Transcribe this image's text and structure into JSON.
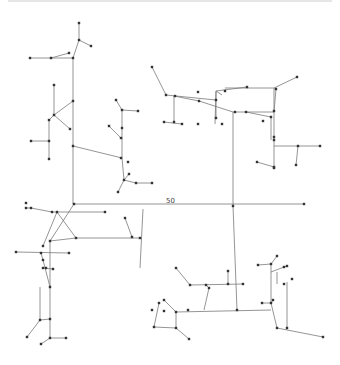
{
  "diagram": {
    "label": "50",
    "label_pos": [
      166,
      203
    ],
    "colors": {
      "edge": "#7a7a7a",
      "node": "#333333",
      "background": "#ffffff"
    },
    "nodes": [
      [
        79,
        23
      ],
      [
        79,
        40
      ],
      [
        91,
        46
      ],
      [
        30,
        58
      ],
      [
        51,
        58
      ],
      [
        69,
        53
      ],
      [
        73,
        58
      ],
      [
        73,
        101
      ],
      [
        54,
        85
      ],
      [
        54,
        115
      ],
      [
        49,
        120
      ],
      [
        70,
        129
      ],
      [
        31,
        141
      ],
      [
        49,
        141
      ],
      [
        49,
        159
      ],
      [
        73,
        146
      ],
      [
        116,
        100
      ],
      [
        122,
        110
      ],
      [
        138,
        111
      ],
      [
        122,
        128
      ],
      [
        109,
        126
      ],
      [
        121,
        138
      ],
      [
        121,
        158
      ],
      [
        128,
        162
      ],
      [
        124,
        180
      ],
      [
        129,
        174
      ],
      [
        136,
        183
      ],
      [
        152,
        183
      ],
      [
        118,
        192
      ],
      [
        152,
        67
      ],
      [
        166,
        95
      ],
      [
        175,
        96
      ],
      [
        199,
        101
      ],
      [
        174,
        122
      ],
      [
        164,
        122
      ],
      [
        182,
        124
      ],
      [
        216,
        118
      ],
      [
        198,
        92
      ],
      [
        198,
        124
      ],
      [
        216,
        100
      ],
      [
        222,
        124
      ],
      [
        225,
        91
      ],
      [
        247,
        87
      ],
      [
        235,
        112
      ],
      [
        246,
        112
      ],
      [
        274,
        111
      ],
      [
        271,
        117
      ],
      [
        276,
        89
      ],
      [
        297,
        77
      ],
      [
        263,
        121
      ],
      [
        274,
        140
      ],
      [
        274,
        137
      ],
      [
        274,
        168
      ],
      [
        298,
        146
      ],
      [
        320,
        146
      ],
      [
        296,
        165
      ],
      [
        257,
        162
      ],
      [
        274,
        167
      ],
      [
        74,
        204
      ],
      [
        26,
        203
      ],
      [
        26,
        208
      ],
      [
        31,
        208
      ],
      [
        52,
        212
      ],
      [
        57,
        212
      ],
      [
        105,
        212
      ],
      [
        43,
        246
      ],
      [
        50,
        241
      ],
      [
        76,
        238
      ],
      [
        132,
        237
      ],
      [
        140,
        238
      ],
      [
        125,
        218
      ],
      [
        233,
        206
      ],
      [
        304,
        204
      ],
      [
        16,
        252
      ],
      [
        41,
        253
      ],
      [
        43,
        260
      ],
      [
        69,
        253
      ],
      [
        43,
        268
      ],
      [
        46,
        268
      ],
      [
        53,
        269
      ],
      [
        50,
        287
      ],
      [
        40,
        320
      ],
      [
        50,
        319
      ],
      [
        27,
        337
      ],
      [
        50,
        338
      ],
      [
        66,
        338
      ],
      [
        41,
        344
      ],
      [
        164,
        300
      ],
      [
        152,
        310
      ],
      [
        159,
        303
      ],
      [
        176,
        268
      ],
      [
        190,
        285
      ],
      [
        206,
        285
      ],
      [
        209,
        288
      ],
      [
        228,
        284
      ],
      [
        243,
        284
      ],
      [
        228,
        271
      ],
      [
        188,
        310
      ],
      [
        237,
        310
      ],
      [
        164,
        311
      ],
      [
        176,
        312
      ],
      [
        154,
        327
      ],
      [
        176,
        328
      ],
      [
        189,
        339
      ],
      [
        258,
        265
      ],
      [
        271,
        264
      ],
      [
        277,
        256
      ],
      [
        284,
        267
      ],
      [
        287,
        266
      ],
      [
        284,
        284
      ],
      [
        292,
        279
      ],
      [
        273,
        300
      ],
      [
        271,
        303
      ],
      [
        262,
        303
      ],
      [
        277,
        328
      ],
      [
        287,
        328
      ],
      [
        323,
        337
      ]
    ],
    "edges": [
      [
        [
          79,
          23
        ],
        [
          79,
          40
        ]
      ],
      [
        [
          79,
          40
        ],
        [
          91,
          46
        ]
      ],
      [
        [
          79,
          40
        ],
        [
          73,
          58
        ]
      ],
      [
        [
          30,
          58
        ],
        [
          51,
          58
        ]
      ],
      [
        [
          51,
          58
        ],
        [
          69,
          53
        ]
      ],
      [
        [
          51,
          58
        ],
        [
          73,
          58
        ]
      ],
      [
        [
          73,
          58
        ],
        [
          73,
          204
        ]
      ],
      [
        [
          73,
          101
        ],
        [
          54,
          115
        ]
      ],
      [
        [
          54,
          85
        ],
        [
          54,
          115
        ]
      ],
      [
        [
          54,
          115
        ],
        [
          70,
          129
        ]
      ],
      [
        [
          54,
          115
        ],
        [
          49,
          120
        ]
      ],
      [
        [
          49,
          120
        ],
        [
          49,
          159
        ]
      ],
      [
        [
          31,
          141
        ],
        [
          49,
          141
        ]
      ],
      [
        [
          73,
          146
        ],
        [
          122,
          158
        ]
      ],
      [
        [
          116,
          100
        ],
        [
          122,
          110
        ]
      ],
      [
        [
          122,
          110
        ],
        [
          138,
          111
        ]
      ],
      [
        [
          122,
          110
        ],
        [
          122,
          158
        ]
      ],
      [
        [
          109,
          126
        ],
        [
          121,
          138
        ]
      ],
      [
        [
          122,
          158
        ],
        [
          124,
          180
        ]
      ],
      [
        [
          124,
          180
        ],
        [
          129,
          174
        ]
      ],
      [
        [
          124,
          180
        ],
        [
          136,
          183
        ]
      ],
      [
        [
          136,
          183
        ],
        [
          152,
          183
        ]
      ],
      [
        [
          124,
          180
        ],
        [
          118,
          192
        ]
      ],
      [
        [
          152,
          67
        ],
        [
          166,
          95
        ]
      ],
      [
        [
          166,
          95
        ],
        [
          216,
          100
        ]
      ],
      [
        [
          174,
          96
        ],
        [
          174,
          122
        ]
      ],
      [
        [
          174,
          96
        ],
        [
          199,
          101
        ]
      ],
      [
        [
          164,
          122
        ],
        [
          182,
          124
        ]
      ],
      [
        [
          199,
          101
        ],
        [
          233,
          112
        ]
      ],
      [
        [
          216,
          118
        ],
        [
          216,
          91
        ]
      ],
      [
        [
          216,
          91
        ],
        [
          247,
          87
        ]
      ],
      [
        [
          216,
          91
        ],
        [
          222,
          95
        ]
      ],
      [
        [
          216,
          91
        ],
        [
          215,
          124
        ]
      ],
      [
        [
          233,
          112
        ],
        [
          274,
          112
        ]
      ],
      [
        [
          233,
          112
        ],
        [
          233,
          206
        ]
      ],
      [
        [
          246,
          112
        ],
        [
          271,
          117
        ]
      ],
      [
        [
          271,
          117
        ],
        [
          271,
          140
        ]
      ],
      [
        [
          225,
          88
        ],
        [
          274,
          88
        ]
      ],
      [
        [
          274,
          88
        ],
        [
          297,
          77
        ]
      ],
      [
        [
          274,
          88
        ],
        [
          274,
          168
        ]
      ],
      [
        [
          274,
          112
        ],
        [
          276,
          89
        ]
      ],
      [
        [
          274,
          146
        ],
        [
          320,
          146
        ]
      ],
      [
        [
          298,
          146
        ],
        [
          296,
          165
        ]
      ],
      [
        [
          257,
          162
        ],
        [
          274,
          167
        ]
      ],
      [
        [
          74,
          204
        ],
        [
          304,
          204
        ]
      ],
      [
        [
          26,
          208
        ],
        [
          31,
          208
        ]
      ],
      [
        [
          31,
          208
        ],
        [
          52,
          212
        ]
      ],
      [
        [
          52,
          212
        ],
        [
          105,
          212
        ]
      ],
      [
        [
          74,
          204
        ],
        [
          50,
          241
        ]
      ],
      [
        [
          57,
          212
        ],
        [
          43,
          246
        ]
      ],
      [
        [
          57,
          212
        ],
        [
          76,
          238
        ]
      ],
      [
        [
          50,
          241
        ],
        [
          76,
          238
        ]
      ],
      [
        [
          76,
          238
        ],
        [
          140,
          238
        ]
      ],
      [
        [
          132,
          237
        ],
        [
          125,
          218
        ]
      ],
      [
        [
          143,
          209
        ],
        [
          140,
          268
        ]
      ],
      [
        [
          16,
          252
        ],
        [
          69,
          253
        ]
      ],
      [
        [
          41,
          253
        ],
        [
          43,
          260
        ]
      ],
      [
        [
          43,
          260
        ],
        [
          50,
          287
        ]
      ],
      [
        [
          43,
          268
        ],
        [
          53,
          269
        ]
      ],
      [
        [
          50,
          241
        ],
        [
          50,
          338
        ]
      ],
      [
        [
          40,
          320
        ],
        [
          40,
          287
        ]
      ],
      [
        [
          40,
          320
        ],
        [
          50,
          319
        ]
      ],
      [
        [
          40,
          320
        ],
        [
          27,
          337
        ]
      ],
      [
        [
          50,
          338
        ],
        [
          66,
          338
        ]
      ],
      [
        [
          50,
          338
        ],
        [
          41,
          344
        ]
      ],
      [
        [
          233,
          206
        ],
        [
          237,
          310
        ]
      ],
      [
        [
          164,
          300
        ],
        [
          176,
          312
        ]
      ],
      [
        [
          159,
          303
        ],
        [
          154,
          327
        ]
      ],
      [
        [
          176,
          312
        ],
        [
          176,
          328
        ]
      ],
      [
        [
          154,
          327
        ],
        [
          176,
          328
        ]
      ],
      [
        [
          176,
          328
        ],
        [
          189,
          339
        ]
      ],
      [
        [
          176,
          268
        ],
        [
          190,
          285
        ]
      ],
      [
        [
          190,
          285
        ],
        [
          243,
          284
        ]
      ],
      [
        [
          206,
          285
        ],
        [
          209,
          288
        ]
      ],
      [
        [
          209,
          288
        ],
        [
          204,
          310
        ]
      ],
      [
        [
          228,
          284
        ],
        [
          228,
          271
        ]
      ],
      [
        [
          176,
          312
        ],
        [
          271,
          310
        ]
      ],
      [
        [
          258,
          265
        ],
        [
          271,
          264
        ]
      ],
      [
        [
          271,
          264
        ],
        [
          277,
          256
        ]
      ],
      [
        [
          271,
          264
        ],
        [
          271,
          303
        ]
      ],
      [
        [
          271,
          272
        ],
        [
          284,
          267
        ]
      ],
      [
        [
          284,
          267
        ],
        [
          287,
          266
        ]
      ],
      [
        [
          277,
          272
        ],
        [
          277,
          284
        ]
      ],
      [
        [
          273,
          300
        ],
        [
          271,
          303
        ]
      ],
      [
        [
          262,
          303
        ],
        [
          271,
          303
        ]
      ],
      [
        [
          271,
          303
        ],
        [
          277,
          328
        ]
      ],
      [
        [
          277,
          328
        ],
        [
          323,
          337
        ]
      ],
      [
        [
          287,
          328
        ],
        [
          287,
          282
        ]
      ]
    ]
  }
}
